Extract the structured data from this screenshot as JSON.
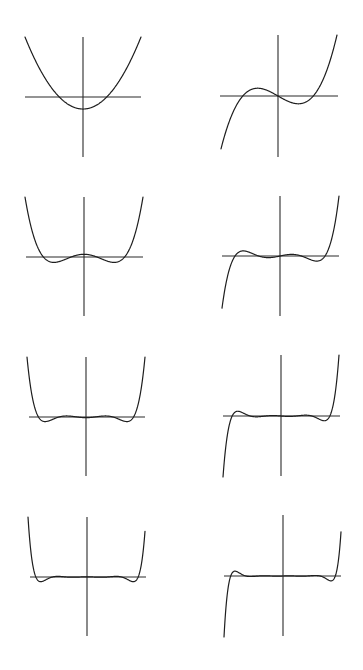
{
  "figure": {
    "width": 363,
    "height": 670,
    "background": "#ffffff",
    "ink_color": "#1e1e1e"
  },
  "chart_data": {
    "type": "line",
    "title": "",
    "xlabel": "",
    "ylabel": "",
    "grid": false,
    "legend": "none",
    "layout": {
      "rows": 4,
      "cols": 2
    },
    "panels": [
      {
        "id": "degree-2",
        "degree": 2,
        "parity": "even",
        "axes": {
          "vx": 83,
          "vy0": 37,
          "vy1": 157,
          "hy": 97,
          "hx0": 25,
          "hx1": 141
        },
        "curve": {
          "x0": 25,
          "x1": 141,
          "y_top": 37,
          "xmax": 1.73,
          "yscale_end": 1.0
        },
        "extrema_px": [
          [
            83,
            127
          ]
        ],
        "roots_count": 2
      },
      {
        "id": "degree-3",
        "degree": 3,
        "parity": "odd",
        "axes": {
          "vx": 278,
          "vy0": 35,
          "vy1": 157,
          "hy": 96,
          "hx0": 220,
          "hx1": 338
        },
        "curve": {
          "x0": 221,
          "x1": 337,
          "y_top": 35,
          "xmax": 2.05
        },
        "extrema_px": [
          [
            253,
            70
          ],
          [
            305,
            123
          ]
        ],
        "roots_count": 3
      },
      {
        "id": "degree-4",
        "degree": 4,
        "parity": "even",
        "axes": {
          "vx": 84,
          "vy0": 197,
          "vy1": 316,
          "hy": 257,
          "hx0": 26,
          "hx1": 143
        },
        "curve": {
          "x0": 25,
          "x1": 143,
          "y_top": 197,
          "xmax": 2.4
        },
        "extrema_px": [
          [
            46,
            283
          ],
          [
            84,
            234
          ],
          [
            123,
            283
          ]
        ],
        "roots_count": 4
      },
      {
        "id": "degree-5",
        "degree": 5,
        "parity": "odd",
        "axes": {
          "vx": 280,
          "vy0": 196,
          "vy1": 316,
          "hy": 256,
          "hx0": 222,
          "hx1": 339
        },
        "curve": {
          "x0": 222,
          "x1": 339,
          "y_top": 196,
          "xmax": 2.65
        },
        "extrema_px": [
          [
            234,
            231
          ],
          [
            263,
            277
          ],
          [
            298,
            234
          ],
          [
            325,
            280
          ]
        ],
        "roots_count": 5
      },
      {
        "id": "degree-6",
        "degree": 6,
        "parity": "even",
        "axes": {
          "vx": 86,
          "vy0": 357,
          "vy1": 476,
          "hy": 417,
          "hx0": 29,
          "hx1": 145
        },
        "curve": {
          "x0": 27,
          "x1": 145,
          "y_top": 357,
          "xmax": 2.92
        },
        "extrema_px": [
          [
            37,
            441
          ],
          [
            60,
            397
          ],
          [
            86,
            436
          ],
          [
            113,
            397
          ],
          [
            134,
            441
          ]
        ],
        "roots_count": 6
      },
      {
        "id": "degree-7",
        "degree": 7,
        "parity": "odd",
        "axes": {
          "vx": 281,
          "vy0": 355,
          "vy1": 476,
          "hy": 416,
          "hx0": 223,
          "hx1": 340
        },
        "curve": {
          "x0": 223,
          "x1": 339,
          "y_top": 355,
          "xmax": 3.15
        },
        "extrema_px": [
          [
            230,
            391
          ],
          [
            247,
            435
          ],
          [
            268,
            398
          ],
          [
            294,
            433
          ],
          [
            316,
            396
          ],
          [
            333,
            440
          ]
        ],
        "roots_count": 7
      },
      {
        "id": "degree-8",
        "degree": 8,
        "parity": "even",
        "axes": {
          "vx": 87,
          "vy0": 517,
          "vy1": 636,
          "hy": 577,
          "hx0": 30,
          "hx1": 146
        },
        "curve": {
          "x0": 28,
          "x1": 145,
          "y_top": 517,
          "xmax": 3.38
        },
        "extrema_px": [
          [
            34,
            600
          ],
          [
            48,
            558
          ],
          [
            66,
            593
          ],
          [
            87,
            561
          ],
          [
            108,
            593
          ],
          [
            126,
            558
          ],
          [
            140,
            600
          ]
        ],
        "roots_count": 8
      },
      {
        "id": "degree-9",
        "degree": 9,
        "parity": "odd",
        "axes": {
          "vx": 283,
          "vy0": 515,
          "vy1": 636,
          "hy": 576,
          "hx0": 224,
          "hx1": 341
        },
        "curve": {
          "x0": 224,
          "x1": 341,
          "y_top": 515,
          "xmax": 3.6
        },
        "extrema_px": [
          [
            228,
            552
          ],
          [
            239,
            595
          ],
          [
            254,
            560
          ],
          [
            274,
            591
          ],
          [
            291,
            561
          ],
          [
            310,
            592
          ],
          [
            326,
            557
          ],
          [
            337,
            599
          ]
        ],
        "roots_count": 9
      }
    ]
  }
}
